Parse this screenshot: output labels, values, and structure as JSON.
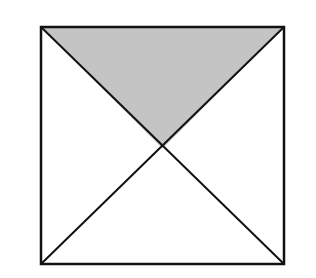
{
  "diagram": {
    "square": {
      "x": 41,
      "y": 27,
      "size": 243
    },
    "center": {
      "x": 162.5,
      "y": 148.5
    },
    "shaded_region": "top",
    "colors": {
      "stroke": "#111111",
      "shade": "#c4c4c4",
      "background": "#ffffff"
    }
  }
}
